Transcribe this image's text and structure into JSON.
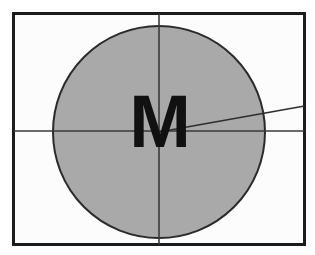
{
  "figure": {
    "canvas": {
      "width": 315,
      "height": 255,
      "background": "#ffffff"
    },
    "frame": {
      "name": "bounding-rectangle",
      "x": 13.5,
      "y": 13.5,
      "width": 291,
      "height": 231,
      "stroke": "#1c1c1c",
      "stroke_width": 3,
      "fill": "#fcfcfc"
    },
    "circle": {
      "name": "construction-circle",
      "cx": 159,
      "cy": 132,
      "r": 106,
      "fill": "#a9a9a9",
      "stroke": "#2b2b2b",
      "stroke_width": 2
    },
    "lines": [
      {
        "name": "vertical-axis",
        "orientation": "vertical",
        "x1": 159,
        "y1": 13.5,
        "x2": 159,
        "y2": 244.5,
        "stroke": "#3a3a3a",
        "stroke_width": 1.6
      },
      {
        "name": "horizontal-axis",
        "orientation": "horizontal",
        "x1": 13.5,
        "y1": 131,
        "x2": 304.5,
        "y2": 131,
        "stroke": "#3a3a3a",
        "stroke_width": 1.6
      },
      {
        "name": "diagonal-angle-line",
        "orientation": "diagonal",
        "x1": 159,
        "y1": 132,
        "x2": 304.5,
        "y2": 106,
        "stroke": "#2e2e2e",
        "stroke_width": 1.6
      }
    ],
    "letter": {
      "name": "letter-m-glyph",
      "text": "M",
      "x": 160,
      "y": 147,
      "font_size": 74,
      "color": "#111111",
      "weight": "bold"
    },
    "colors": {
      "ink": "#1c1c1c",
      "fill_gray": "#a9a9a9",
      "paper": "#fcfcfc",
      "rule": "#3a3a3a"
    }
  }
}
